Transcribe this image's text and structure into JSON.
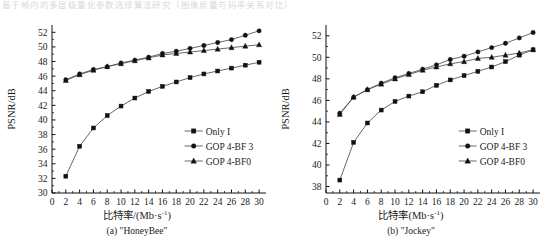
{
  "page": {
    "top_strip_text": "基于帧内的多层级量化参数选择算法研究（图像质量与码率关系对比）",
    "background_color": "#ffffff",
    "ink_color": "#1a1a1a"
  },
  "legend": {
    "entries": [
      {
        "label": "Only I",
        "marker": "square",
        "key": "only_i"
      },
      {
        "label": "GOP 4-BF 3",
        "marker": "circle",
        "key": "gop4_bf3"
      },
      {
        "label": "GOP 4-BF0",
        "marker": "triangle",
        "key": "gop4_bf0"
      }
    ]
  },
  "chart_data": [
    {
      "id": "a",
      "type": "line",
      "title": "(a) \"HoneyBee\"",
      "caption": "(a) \"HoneyBee\"",
      "xlabel": "比特率/(Mb·s⁻¹)",
      "xlabel_main": "比特率/(Mb·s",
      "xlabel_sup": "-1",
      "xlabel_tail": ")",
      "ylabel": "PSNR/dB",
      "xlim": [
        0,
        31
      ],
      "ylim": [
        30,
        53
      ],
      "xticks": [
        0,
        2,
        4,
        6,
        8,
        10,
        12,
        14,
        16,
        18,
        20,
        22,
        24,
        26,
        28,
        30
      ],
      "yticks": [
        30,
        32,
        34,
        36,
        38,
        40,
        42,
        44,
        46,
        48,
        50,
        52
      ],
      "grid": false,
      "legend_position": "lower-right",
      "x": [
        2,
        4,
        6,
        8,
        10,
        12,
        14,
        16,
        18,
        20,
        22,
        24,
        26,
        28,
        30
      ],
      "series": [
        {
          "name": "Only I",
          "marker": "square",
          "values": [
            32.3,
            36.4,
            38.9,
            40.6,
            41.9,
            43.0,
            43.9,
            44.6,
            45.2,
            45.8,
            46.3,
            46.7,
            47.1,
            47.5,
            47.9
          ]
        },
        {
          "name": "GOP 4-BF 3",
          "marker": "circle",
          "values": [
            45.5,
            46.3,
            46.9,
            47.3,
            47.8,
            48.2,
            48.6,
            49.1,
            49.4,
            49.8,
            50.2,
            50.6,
            51.0,
            51.6,
            52.2
          ]
        },
        {
          "name": "GOP 4-BF0",
          "marker": "triangle",
          "values": [
            45.4,
            46.2,
            46.8,
            47.3,
            47.7,
            48.1,
            48.5,
            48.9,
            49.1,
            49.3,
            49.5,
            49.7,
            49.9,
            50.1,
            50.3
          ]
        }
      ]
    },
    {
      "id": "b",
      "type": "line",
      "title": "(b) \"Jockey\"",
      "caption": "(b) \"Jockey\"",
      "xlabel": "比特率(Mb·s⁻¹)",
      "xlabel_main": "比特率(Mb·s",
      "xlabel_sup": "-1",
      "xlabel_tail": ")",
      "ylabel": "PSNR/dB",
      "xlim": [
        0,
        31
      ],
      "ylim": [
        37.4,
        53
      ],
      "xticks": [
        0,
        2,
        4,
        6,
        8,
        10,
        12,
        14,
        16,
        18,
        20,
        22,
        24,
        26,
        28,
        30
      ],
      "yticks": [
        38,
        40,
        42,
        44,
        46,
        48,
        50,
        52
      ],
      "grid": false,
      "legend_position": "lower-right",
      "x": [
        2,
        4,
        6,
        8,
        10,
        12,
        14,
        16,
        18,
        20,
        22,
        24,
        26,
        28,
        30
      ],
      "series": [
        {
          "name": "Only I",
          "marker": "square",
          "values": [
            38.6,
            42.1,
            43.9,
            45.1,
            45.9,
            46.4,
            46.8,
            47.4,
            47.9,
            48.3,
            48.7,
            49.1,
            49.6,
            50.2,
            50.7
          ]
        },
        {
          "name": "GOP 4-BF 3",
          "marker": "circle",
          "values": [
            44.8,
            46.3,
            47.0,
            47.6,
            48.1,
            48.5,
            48.9,
            49.3,
            49.8,
            50.1,
            50.5,
            50.9,
            51.3,
            51.8,
            52.3
          ]
        },
        {
          "name": "GOP 4-BF0",
          "marker": "triangle",
          "values": [
            44.7,
            46.3,
            47.0,
            47.5,
            48.0,
            48.4,
            48.8,
            49.1,
            49.4,
            49.6,
            49.9,
            50.0,
            50.2,
            50.4,
            50.7
          ]
        }
      ]
    }
  ]
}
